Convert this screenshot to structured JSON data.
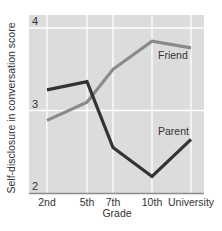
{
  "chart_data": {
    "type": "line",
    "title": "",
    "xlabel": "Grade",
    "ylabel": "Self-disclosure in conversation score",
    "categories": [
      "2nd",
      "5th",
      "7th",
      "10th",
      "University"
    ],
    "series": [
      {
        "name": "Friend",
        "values": [
          2.88,
          3.1,
          3.5,
          3.84,
          3.76
        ],
        "color": "#8a8a8a"
      },
      {
        "name": "Parent",
        "values": [
          3.25,
          3.35,
          2.55,
          2.2,
          2.65
        ],
        "color": "#333333"
      }
    ],
    "yticks": [
      "2",
      "3",
      "4"
    ],
    "ylim": [
      2,
      4.15
    ],
    "grid": true,
    "legend": "inline labels on lines",
    "plot_background": "#dcdcdc"
  }
}
